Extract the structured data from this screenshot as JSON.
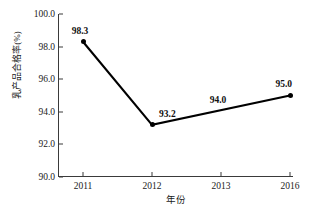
{
  "chart_data": {
    "type": "line",
    "title": "",
    "xlabel": "年份",
    "ylabel": "乳产品合格率(%)",
    "categories": [
      "2011",
      "2012",
      "2013",
      "2016"
    ],
    "values": [
      98.3,
      93.2,
      94.0,
      95.0
    ],
    "point_labels": [
      "98.3",
      "93.2",
      "94.0",
      "95.0"
    ],
    "markers_shown": [
      true,
      true,
      false,
      true
    ],
    "line_vertices": [
      {
        "category": "2011",
        "value": 98.3
      },
      {
        "category": "2012",
        "value": 93.2
      },
      {
        "category": "2016",
        "value": 95.0
      }
    ],
    "ylim": [
      90.0,
      100.0
    ],
    "ytick_values": [
      100.0,
      98.0,
      96.0,
      94.0,
      92.0,
      90.0
    ],
    "ytick_labels": [
      "100.0",
      "98.0",
      "96.0",
      "94.0",
      "92.0",
      "90.0"
    ],
    "xtick_labels": [
      "2011",
      "2012",
      "2013",
      "2016"
    ],
    "grid": false,
    "legend": null,
    "series_color": "#000000",
    "axis_color": "#3a3a3a",
    "background_color": "#ffffff"
  }
}
